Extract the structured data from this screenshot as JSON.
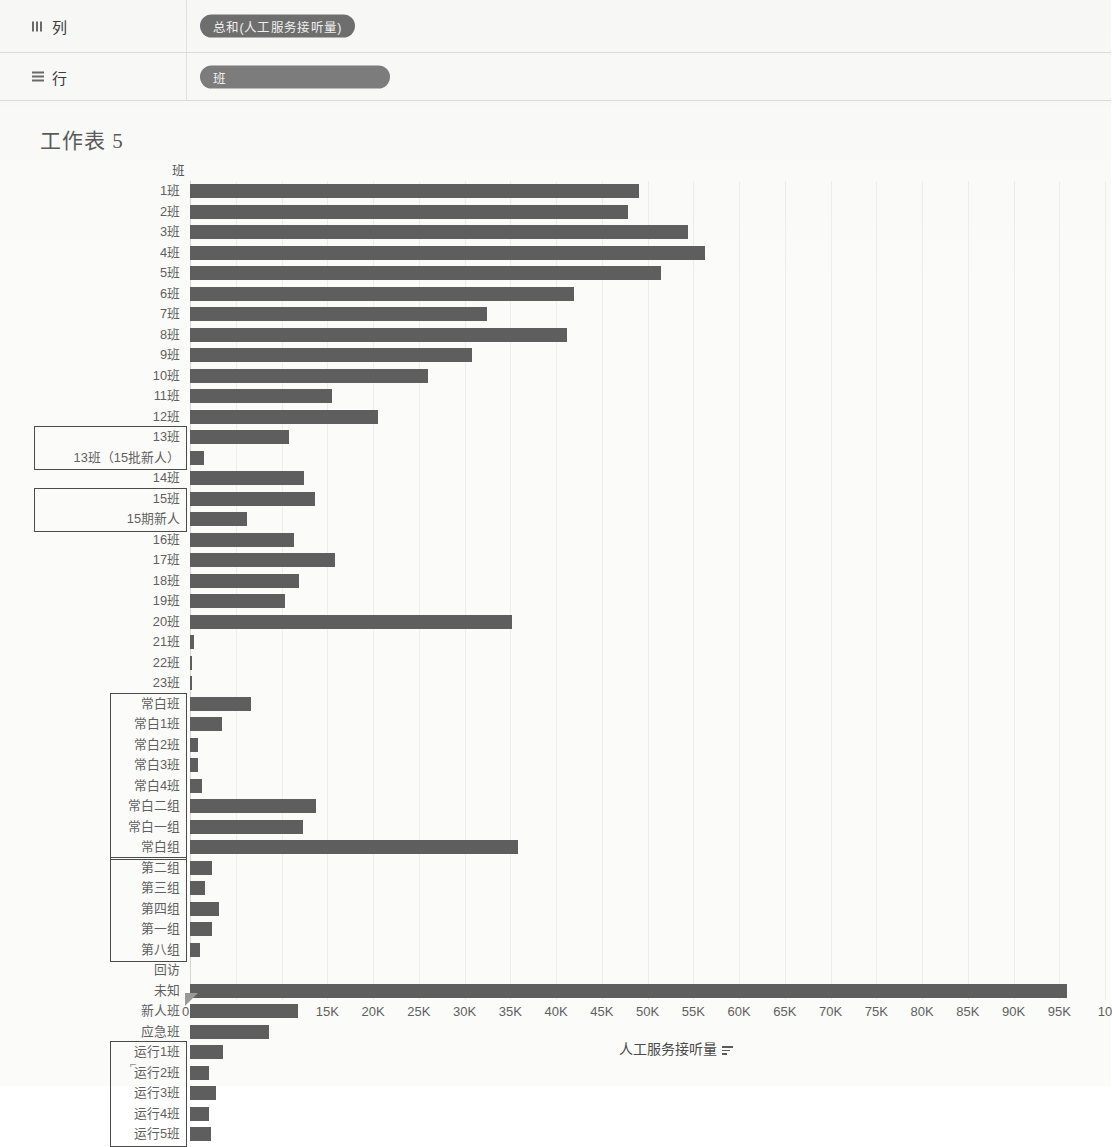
{
  "shelves": {
    "columns": {
      "label": "列",
      "icon": "columns-icon",
      "pill": "总和(人工服务接听量)"
    },
    "rows": {
      "label": "行",
      "icon": "rows-icon",
      "pill": "班"
    }
  },
  "worksheet": {
    "title": "工作表 5"
  },
  "chart_data": {
    "type": "bar",
    "orientation": "horizontal",
    "title": "工作表 5",
    "xlabel": "人工服务接听量",
    "ylabel": "班",
    "xlim": [
      0,
      100000
    ],
    "xticks": [
      "0K",
      "5K",
      "10K",
      "15K",
      "20K",
      "25K",
      "30K",
      "35K",
      "40K",
      "45K",
      "50K",
      "55K",
      "60K",
      "65K",
      "70K",
      "75K",
      "80K",
      "85K",
      "90K",
      "95K",
      "10"
    ],
    "xtick_values": [
      0,
      5000,
      10000,
      15000,
      20000,
      25000,
      30000,
      35000,
      40000,
      45000,
      50000,
      55000,
      60000,
      65000,
      70000,
      75000,
      80000,
      85000,
      90000,
      95000,
      100000
    ],
    "grid": true,
    "legend": false,
    "bar_color": "#5e5e5e",
    "categories": [
      "1班",
      "2班",
      "3班",
      "4班",
      "5班",
      "6班",
      "7班",
      "8班",
      "9班",
      "10班",
      "11班",
      "12班",
      "13班",
      "13班（15批新人）",
      "14班",
      "15班",
      "15期新人",
      "16班",
      "17班",
      "18班",
      "19班",
      "20班",
      "21班",
      "22班",
      "23班",
      "常白班",
      "常白1班",
      "常白2班",
      "常白3班",
      "常白4班",
      "常白二组",
      "常白一组",
      "常白组",
      "第二组",
      "第三组",
      "第四组",
      "第一组",
      "第八组",
      "回访",
      "未知",
      "新人班",
      "应急班",
      "运行1班",
      "运行2班",
      "运行3班",
      "运行4班",
      "运行5班"
    ],
    "values": [
      49100,
      47900,
      54400,
      56300,
      51500,
      42000,
      32500,
      41200,
      30800,
      26000,
      15500,
      20500,
      10800,
      1500,
      12500,
      13700,
      6200,
      11400,
      15800,
      11900,
      10400,
      35200,
      400,
      250,
      250,
      6700,
      3500,
      900,
      900,
      1300,
      13800,
      12400,
      35800,
      2400,
      1600,
      3200,
      2400,
      1100,
      0,
      95800,
      11800,
      8600,
      3600,
      2100,
      2800,
      2100,
      2300
    ],
    "highlight_groups": [
      {
        "name": "13班（15批新人）",
        "from": "13班",
        "to": "13班（15批新人）"
      },
      {
        "name": "15期新人",
        "from": "15班",
        "to": "15期新人"
      },
      {
        "name": "常白组",
        "from": "常白班",
        "to": "常白组"
      },
      {
        "name": "分组",
        "from": "第二组",
        "to": "第八组"
      },
      {
        "name": "运行班",
        "from": "运行1班",
        "to": "运行5班"
      }
    ]
  }
}
